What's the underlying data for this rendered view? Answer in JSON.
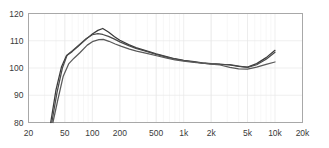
{
  "chart_data": {
    "type": "line",
    "title": "",
    "subtitle": "",
    "xlabel": "",
    "ylabel": "",
    "xscale": "log",
    "xlim": [
      20,
      20000
    ],
    "ylim": [
      80,
      120
    ],
    "grid": true,
    "legend_position": "none",
    "xticks": [
      {
        "value": 20,
        "label": "20"
      },
      {
        "value": 50,
        "label": "50"
      },
      {
        "value": 100,
        "label": "100"
      },
      {
        "value": 200,
        "label": "200"
      },
      {
        "value": 500,
        "label": "500"
      },
      {
        "value": 1000,
        "label": "1k"
      },
      {
        "value": 2000,
        "label": "2k"
      },
      {
        "value": 5000,
        "label": "5k"
      },
      {
        "value": 10000,
        "label": "10k"
      },
      {
        "value": 20000,
        "label": "20k"
      }
    ],
    "yticks": [
      {
        "value": 80,
        "label": "80"
      },
      {
        "value": 90,
        "label": "90"
      },
      {
        "value": 100,
        "label": "100"
      },
      {
        "value": 110,
        "label": "110"
      },
      {
        "value": 120,
        "label": "120"
      }
    ],
    "series": [
      {
        "name": "curve-1",
        "color": "#3b3b3b",
        "x": [
          35,
          40,
          46,
          52,
          60,
          70,
          85,
          100,
          115,
          130,
          150,
          175,
          200,
          250,
          300,
          400,
          500,
          650,
          800,
          1000,
          1300,
          1600,
          2000,
          2500,
          3200,
          4000,
          5000,
          6300,
          8000,
          10000
        ],
        "y": [
          79.5,
          92.0,
          100.5,
          104.5,
          106.0,
          108.0,
          110.5,
          112.5,
          113.8,
          114.5,
          113.2,
          111.5,
          110.2,
          108.6,
          107.5,
          106.2,
          105.2,
          104.2,
          103.4,
          102.8,
          102.3,
          101.9,
          101.6,
          101.4,
          101.1,
          100.6,
          100.3,
          101.6,
          103.8,
          106.5
        ]
      },
      {
        "name": "curve-2",
        "color": "#4a4a4a",
        "x": [
          36,
          41,
          47,
          53,
          61,
          71,
          86,
          100,
          115,
          130,
          150,
          175,
          200,
          250,
          300,
          400,
          500,
          650,
          800,
          1000,
          1300,
          1600,
          2000,
          2500,
          3200,
          4000,
          5000,
          6300,
          8000,
          10000
        ],
        "y": [
          79.5,
          91.0,
          100.0,
          104.8,
          106.4,
          108.4,
          110.8,
          112.2,
          112.6,
          112.3,
          111.6,
          110.6,
          109.6,
          108.2,
          107.2,
          106.0,
          105.0,
          104.0,
          103.3,
          102.7,
          102.2,
          101.8,
          101.5,
          101.3,
          101.2,
          100.7,
          100.2,
          101.2,
          103.2,
          105.8
        ]
      },
      {
        "name": "curve-3",
        "color": "#5a5a5a",
        "x": [
          37,
          42,
          48,
          55,
          63,
          73,
          88,
          102,
          118,
          132,
          152,
          178,
          205,
          255,
          305,
          405,
          505,
          655,
          805,
          1000,
          1300,
          1600,
          2000,
          2500,
          3200,
          4000,
          5000,
          6300,
          8000,
          10000
        ],
        "y": [
          79.5,
          88.5,
          97.0,
          101.5,
          103.6,
          105.6,
          108.4,
          109.8,
          110.4,
          110.5,
          109.8,
          108.8,
          108.0,
          106.9,
          106.2,
          105.3,
          104.5,
          103.6,
          103.0,
          102.5,
          102.1,
          101.8,
          101.4,
          101.1,
          100.2,
          99.7,
          99.6,
          100.3,
          101.3,
          102.2
        ]
      }
    ]
  },
  "axes": {
    "frame_color": "#a8a8a8",
    "grid_color": "#e8e8e8",
    "background": "#ffffff",
    "tick_label_color": "#3a3a3a"
  }
}
